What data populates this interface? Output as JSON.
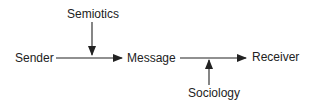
{
  "diagram": {
    "nodes": {
      "sender": "Sender",
      "message": "Message",
      "receiver": "Receiver"
    },
    "influences": {
      "semiotics": "Semiotics",
      "sociology": "Sociology"
    },
    "edges": [
      {
        "from": "Sender",
        "to": "Message"
      },
      {
        "from": "Message",
        "to": "Receiver"
      },
      {
        "from": "Semiotics",
        "to": "Sender→Message"
      },
      {
        "from": "Sociology",
        "to": "Message→Receiver"
      }
    ],
    "stroke_color": "#222222"
  }
}
